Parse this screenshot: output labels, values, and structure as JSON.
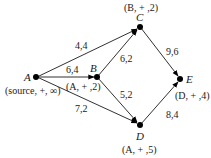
{
  "diagram": {
    "type": "flow-network",
    "nodes": [
      {
        "id": "A",
        "label": "A",
        "tag": "(source, +, ∞)"
      },
      {
        "id": "B",
        "label": "B",
        "tag": "(A, + ,2)"
      },
      {
        "id": "C",
        "label": "C",
        "tag": "(B, + ,2)"
      },
      {
        "id": "D",
        "label": "D",
        "tag": "(A, + ,5)"
      },
      {
        "id": "E",
        "label": "E",
        "tag": "(D, + ,4)"
      }
    ],
    "edges": [
      {
        "from": "A",
        "to": "C",
        "label": "4,4"
      },
      {
        "from": "A",
        "to": "B",
        "label": "6,4"
      },
      {
        "from": "A",
        "to": "D",
        "label": "7,2"
      },
      {
        "from": "B",
        "to": "C",
        "label": "6,2"
      },
      {
        "from": "B",
        "to": "D",
        "label": "5,2"
      },
      {
        "from": "C",
        "to": "E",
        "label": "9,6"
      },
      {
        "from": "D",
        "to": "E",
        "label": "8,4"
      }
    ]
  }
}
